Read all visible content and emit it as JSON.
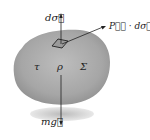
{
  "diagram": {
    "labels": {
      "d_sigma": "dσ⃗",
      "pressure_flux": "P⃗⃗ · dσ⃗",
      "tau": "τ",
      "rho": "ρ",
      "sigma": "Σ",
      "weight": "mg⃗"
    },
    "colors": {
      "body_fill": "#a9a9a9",
      "shadow": "#c8c8c8",
      "line": "#222222"
    }
  }
}
